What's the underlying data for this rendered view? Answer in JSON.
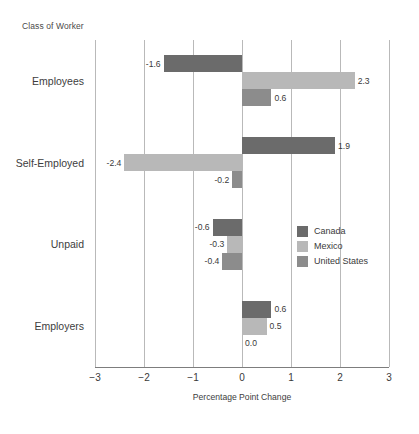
{
  "chart_data": {
    "type": "bar",
    "orientation": "horizontal",
    "title": "Class of Worker",
    "xlabel": "Percentage Point Change",
    "ylabel": "",
    "xlim": [
      -3,
      3
    ],
    "xticks": [
      "−3",
      "−2",
      "−1",
      "0",
      "1",
      "2",
      "3"
    ],
    "xtick_values": [
      -3,
      -2,
      -1,
      0,
      1,
      2,
      3
    ],
    "grid": true,
    "legend_position": "center-right",
    "categories": [
      "Employees",
      "Self-Employed",
      "Unpaid",
      "Employers"
    ],
    "series": [
      {
        "name": "Canada",
        "color": "#6b6b6b",
        "values": [
          -1.6,
          1.9,
          -0.6,
          0.6
        ],
        "labels": [
          "-1.6",
          "1.9",
          "-0.6",
          "0.6"
        ]
      },
      {
        "name": "Mexico",
        "color": "#b8b8b8",
        "values": [
          2.3,
          -2.4,
          -0.3,
          0.5
        ],
        "labels": [
          "2.3",
          "-2.4",
          "-0.3",
          "0.5"
        ]
      },
      {
        "name": "United States",
        "color": "#8c8c8c",
        "values": [
          0.6,
          -0.2,
          -0.4,
          0.0
        ],
        "labels": [
          "0.6",
          "-0.2",
          "-0.4",
          "0.0"
        ]
      }
    ]
  },
  "legend": {
    "items": [
      {
        "label": "Canada",
        "color": "#6b6b6b"
      },
      {
        "label": "Mexico",
        "color": "#b8b8b8"
      },
      {
        "label": "United States",
        "color": "#8c8c8c"
      }
    ]
  },
  "axis": {
    "x_title": "Percentage Point Change"
  }
}
